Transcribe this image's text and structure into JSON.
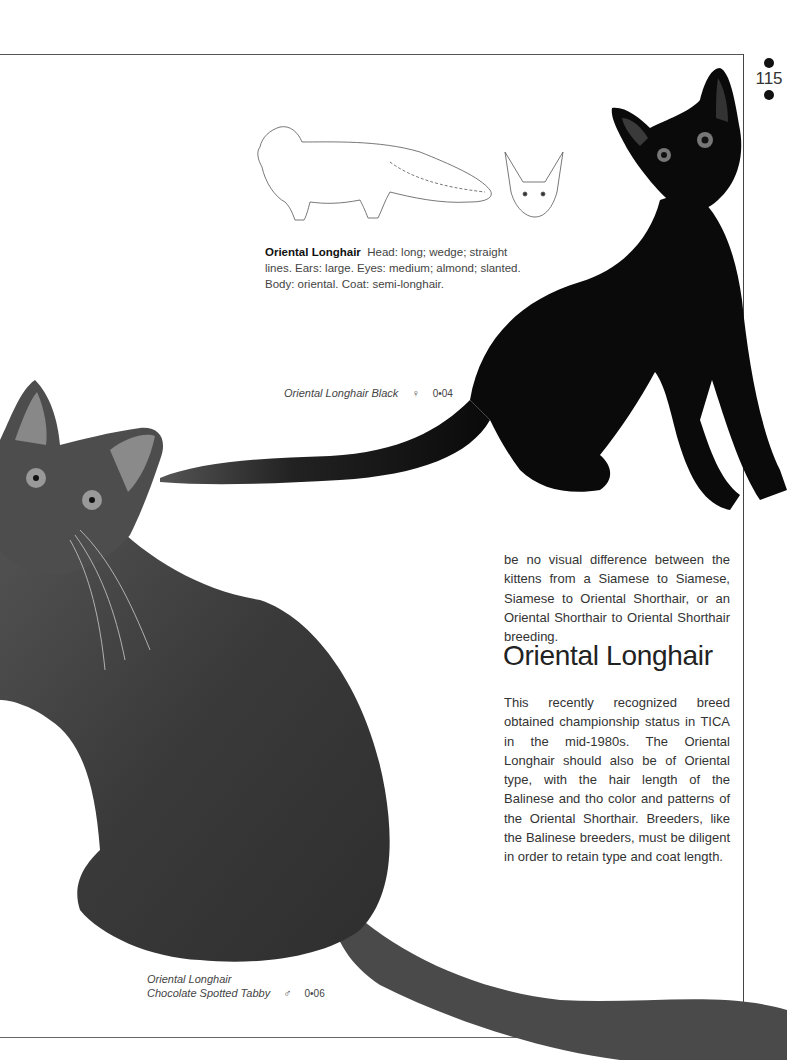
{
  "page": {
    "number": "115",
    "folio_markers": [
      "dot-above",
      "dot-below"
    ]
  },
  "profile": {
    "breed": "Oriental Longhair",
    "description": "Head: long; wedge; straight lines. Ears: large. Eyes: medium; almond; slanted. Body: oriental. Coat: semi-longhair."
  },
  "illustrations": [
    {
      "name": "body-outline-sketch",
      "subject": "Oriental Longhair full body line drawing"
    },
    {
      "name": "head-outline-sketch",
      "subject": "Oriental Longhair head line drawing"
    }
  ],
  "photos": [
    {
      "subject": "black cat sitting",
      "caption": "Oriental Longhair Black",
      "sex_symbol": "♀",
      "age": "0•04"
    },
    {
      "subject": "chocolate spotted tabby cat sitting",
      "caption_line1": "Oriental Longhair",
      "caption_line2": "Chocolate Spotted Tabby",
      "sex_symbol": "♂",
      "age": "0•06"
    }
  ],
  "article": {
    "continued_paragraph": "be no visual difference between the kittens from a Siamese to Siamese, Siamese to Oriental Shorthair, or an Oriental Shorthair to Oriental Shorthair breeding.",
    "heading": "Oriental Longhair",
    "paragraph": "This recently recognized breed obtained championship status in TICA in the mid-1980s. The Oriental Longhair should also be of Oriental type, with the hair length of the Balinese and tho color and patterns of the Oriental Shorthair. Breeders, like the Balinese breeders, must be diligent in order to retain type and coat length."
  },
  "colors": {
    "background": "#ffffff",
    "text": "#333333",
    "black_cat": "#0a0a0a",
    "tabby_cat": "#3a3a3a"
  }
}
